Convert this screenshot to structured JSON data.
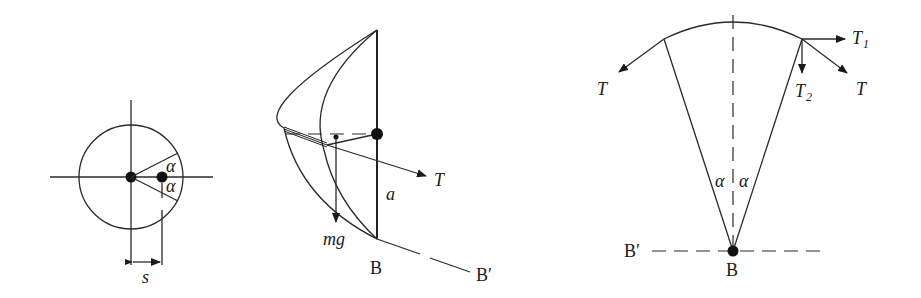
{
  "figure": {
    "panels": [
      {
        "id": "top-view",
        "labels": {
          "alpha_upper": "α",
          "alpha_lower": "α",
          "offset": "s"
        }
      },
      {
        "id": "side-view",
        "labels": {
          "tension": "T",
          "weight": "mg",
          "length": "a",
          "point_b": "B",
          "point_b_prime": "B′"
        }
      },
      {
        "id": "force-diagram",
        "labels": {
          "tension_left": "T",
          "tension_right": "T",
          "t1": "T",
          "t1_sub": "1",
          "t2": "T",
          "t2_sub": "2",
          "alpha_left": "α",
          "alpha_right": "α",
          "point_b": "B",
          "point_b_prime": "B′"
        }
      }
    ]
  },
  "colors": {
    "ink": "#1a1a1a",
    "background": "#ffffff"
  }
}
